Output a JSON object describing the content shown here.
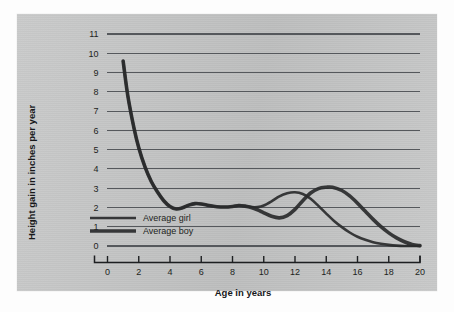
{
  "figure": {
    "panel_bg": "#c3c4c4",
    "page_bg": "#fdfdfd",
    "line_color": "#2a2b2d",
    "grid_color": "#55585c",
    "axis_color": "#1d1f21"
  },
  "axis_titles": {
    "y": "Height gain in inches per year",
    "x": "Age in years"
  },
  "legend": {
    "position": "inside-lower-left",
    "entries": [
      {
        "label": "Average girl",
        "line_width": 2.6,
        "color": "#2a2b2d"
      },
      {
        "label": "Average boy",
        "line_width": 3.6,
        "color": "#2a2b2d"
      }
    ]
  },
  "ticks": {
    "y": [
      "0",
      "1",
      "2",
      "3",
      "4",
      "5",
      "6",
      "7",
      "8",
      "9",
      "10",
      "11"
    ],
    "x": [
      "0",
      "2",
      "4",
      "6",
      "8",
      "10",
      "12",
      "14",
      "16",
      "18",
      "20"
    ]
  },
  "chart_data": {
    "type": "line",
    "title": "",
    "xlabel": "Age in years",
    "ylabel": "Height gain in inches per year",
    "xlim": [
      0,
      20
    ],
    "ylim": [
      0,
      11
    ],
    "xticks": [
      0,
      2,
      4,
      6,
      8,
      10,
      12,
      14,
      16,
      18,
      20
    ],
    "yticks": [
      0,
      1,
      2,
      3,
      4,
      5,
      6,
      7,
      8,
      9,
      10,
      11
    ],
    "grid": "horizontal",
    "legend_position": "lower left inside axes",
    "series": [
      {
        "name": "Average girl",
        "color": "#2a2b2d",
        "x": [
          1.0,
          1.3,
          1.7,
          2.0,
          2.4,
          2.8,
          3.2,
          3.6,
          4.0,
          4.4,
          4.8,
          5.2,
          5.6,
          6.0,
          6.5,
          7.0,
          7.5,
          8.0,
          8.4,
          8.8,
          9.2,
          9.6,
          10.0,
          10.5,
          11.0,
          11.5,
          12.0,
          12.5,
          13.0,
          13.5,
          14.0,
          14.5,
          15.0,
          15.5,
          16.0,
          16.5,
          17.0,
          17.5,
          18.0,
          18.5,
          19.0,
          19.5,
          20.0
        ],
        "y": [
          9.6,
          7.8,
          6.1,
          5.1,
          4.1,
          3.35,
          2.8,
          2.35,
          2.05,
          1.92,
          1.98,
          2.12,
          2.2,
          2.18,
          2.1,
          2.04,
          2.02,
          2.05,
          2.1,
          2.07,
          2.02,
          2.02,
          2.1,
          2.32,
          2.58,
          2.74,
          2.79,
          2.7,
          2.45,
          2.08,
          1.68,
          1.3,
          0.98,
          0.7,
          0.48,
          0.32,
          0.2,
          0.12,
          0.06,
          0.02,
          0.0,
          0.0,
          0.0
        ]
      },
      {
        "name": "Average boy",
        "color": "#2a2b2d",
        "x": [
          1.0,
          1.3,
          1.7,
          2.0,
          2.4,
          2.8,
          3.2,
          3.6,
          4.0,
          4.4,
          4.8,
          5.2,
          5.6,
          6.0,
          6.5,
          7.0,
          7.5,
          8.0,
          8.4,
          8.8,
          9.2,
          9.6,
          10.0,
          10.5,
          11.0,
          11.5,
          12.0,
          12.5,
          13.0,
          13.5,
          14.0,
          14.4,
          15.0,
          15.5,
          16.0,
          16.5,
          17.0,
          17.5,
          18.0,
          18.5,
          19.0,
          19.5,
          20.0
        ],
        "y": [
          9.6,
          7.8,
          6.1,
          5.1,
          4.1,
          3.35,
          2.8,
          2.35,
          2.05,
          1.92,
          1.98,
          2.12,
          2.2,
          2.18,
          2.1,
          2.04,
          2.02,
          2.05,
          2.1,
          2.07,
          2.0,
          1.88,
          1.72,
          1.54,
          1.46,
          1.58,
          1.9,
          2.35,
          2.75,
          2.98,
          3.05,
          3.05,
          2.88,
          2.6,
          2.22,
          1.8,
          1.38,
          1.0,
          0.68,
          0.42,
          0.22,
          0.08,
          0.02
        ]
      }
    ],
    "annotations": [
      "Girl peak growth spurt approximately 2.8 in/yr near age 12",
      "Boy peak growth spurt approximately 3.05 in/yr near age 14",
      "Both curves begin near 9.6 in/yr at age 1 and fall to about 0 by age 20"
    ]
  }
}
